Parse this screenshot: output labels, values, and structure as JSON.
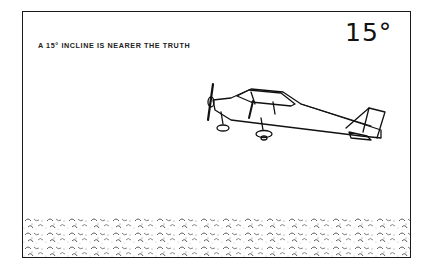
{
  "figure": {
    "caption": "A 15° INCLINE IS NEARER THE TRUTH",
    "angle_label": "15°",
    "ground": "stippled pebble texture"
  },
  "icons": [
    "airplane-illustration",
    "ground-texture"
  ]
}
